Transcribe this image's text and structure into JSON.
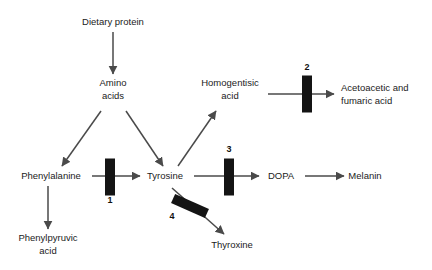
{
  "diagram": {
    "colors": {
      "background": "#ffffff",
      "arrow": "#4a4a4a",
      "block": "#141414",
      "text": "#1b1b1b"
    },
    "nodes": [
      {
        "id": "dietary-protein",
        "lines": [
          "Dietary protein"
        ],
        "x": 113,
        "y": 25,
        "anchor": "middle"
      },
      {
        "id": "amino-acids",
        "lines": [
          "Amino",
          "acids"
        ],
        "x": 113,
        "y": 86,
        "anchor": "middle"
      },
      {
        "id": "homogentisic-acid",
        "lines": [
          "Homogentisic",
          "acid"
        ],
        "x": 230,
        "y": 86,
        "anchor": "middle"
      },
      {
        "id": "acetoacetic-fumaric-acid",
        "lines": [
          "Acetoacetic and",
          "fumaric acid"
        ],
        "x": 341,
        "y": 91,
        "anchor": "start"
      },
      {
        "id": "phenylalanine",
        "lines": [
          "Phenylalanine"
        ],
        "x": 51,
        "y": 179,
        "anchor": "middle"
      },
      {
        "id": "tyrosine",
        "lines": [
          "Tyrosine"
        ],
        "x": 165,
        "y": 179,
        "anchor": "middle"
      },
      {
        "id": "dopa",
        "lines": [
          "DOPA"
        ],
        "x": 281,
        "y": 179,
        "anchor": "middle"
      },
      {
        "id": "melanin",
        "lines": [
          "Melanin"
        ],
        "x": 365,
        "y": 179,
        "anchor": "middle"
      },
      {
        "id": "phenylpyruvic-acid",
        "lines": [
          "Phenylpyruvic",
          "acid"
        ],
        "x": 48,
        "y": 241,
        "anchor": "middle"
      },
      {
        "id": "thyroxine",
        "lines": [
          "Thyroxine"
        ],
        "x": 232,
        "y": 248,
        "anchor": "middle"
      }
    ],
    "arrows": [
      {
        "id": "arrow-dietary-protein-to-amino-acids",
        "from": "dietary-protein",
        "to": "amino-acids",
        "x1": 113,
        "y1": 32,
        "x2": 113,
        "y2": 74
      },
      {
        "id": "arrow-amino-acids-to-phenylalanine",
        "from": "amino-acids",
        "to": "phenylalanine",
        "x1": 101,
        "y1": 111,
        "x2": 62,
        "y2": 166
      },
      {
        "id": "arrow-amino-acids-to-tyrosine",
        "from": "amino-acids",
        "to": "tyrosine",
        "x1": 126,
        "y1": 111,
        "x2": 163,
        "y2": 166
      },
      {
        "id": "arrow-phenylalanine-to-tyrosine",
        "from": "phenylalanine",
        "to": "tyrosine",
        "x1": 92,
        "y1": 176,
        "x2": 140,
        "y2": 176
      },
      {
        "id": "arrow-phenylalanine-to-phenylpyruvic-acid",
        "from": "phenylalanine",
        "to": "phenylpyruvic-acid",
        "x1": 48,
        "y1": 186,
        "x2": 48,
        "y2": 229
      },
      {
        "id": "arrow-tyrosine-to-homogentisic-acid",
        "from": "tyrosine",
        "to": "homogentisic-acid",
        "x1": 178,
        "y1": 166,
        "x2": 216,
        "y2": 111
      },
      {
        "id": "arrow-tyrosine-to-dopa",
        "from": "tyrosine",
        "to": "dopa",
        "x1": 194,
        "y1": 176,
        "x2": 259,
        "y2": 176
      },
      {
        "id": "arrow-tyrosine-to-thyroxine",
        "from": "tyrosine",
        "to": "thyroxine",
        "x1": 172,
        "y1": 188,
        "x2": 224,
        "y2": 234
      },
      {
        "id": "arrow-dopa-to-melanin",
        "from": "dopa",
        "to": "melanin",
        "x1": 305,
        "y1": 176,
        "x2": 344,
        "y2": 176
      },
      {
        "id": "arrow-homogentisic-acid-to-acetoacetic",
        "from": "homogentisic-acid",
        "to": "acetoacetic-fumaric-acid",
        "x1": 268,
        "y1": 94,
        "x2": 334,
        "y2": 94
      }
    ],
    "blocks": [
      {
        "id": "block-1",
        "number": "1",
        "blocks_arrow": "arrow-phenylalanine-to-tyrosine",
        "cx": 110,
        "cy": 177,
        "width": 10,
        "height": 37,
        "rotation": 0,
        "label_x": 110,
        "label_y": 203,
        "label_anchor": "middle"
      },
      {
        "id": "block-2",
        "number": "2",
        "blocks_arrow": "arrow-homogentisic-acid-to-acetoacetic",
        "cx": 307,
        "cy": 94,
        "width": 10,
        "height": 37,
        "rotation": 0,
        "label_x": 307,
        "label_y": 70,
        "label_anchor": "middle"
      },
      {
        "id": "block-3",
        "number": "3",
        "blocks_arrow": "arrow-tyrosine-to-dopa",
        "cx": 229,
        "cy": 177,
        "width": 10,
        "height": 37,
        "rotation": 0,
        "label_x": 229,
        "label_y": 152,
        "label_anchor": "middle"
      },
      {
        "id": "block-4",
        "number": "4",
        "blocks_arrow": "arrow-tyrosine-to-thyroxine",
        "cx": 190,
        "cy": 206,
        "width": 10,
        "height": 37,
        "rotation": -66,
        "label_x": 172,
        "label_y": 219,
        "label_anchor": "middle"
      }
    ]
  }
}
